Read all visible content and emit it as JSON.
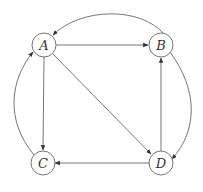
{
  "diagram": {
    "type": "directed-graph",
    "nodes": [
      {
        "id": "A",
        "label": "A"
      },
      {
        "id": "B",
        "label": "B"
      },
      {
        "id": "C",
        "label": "C"
      },
      {
        "id": "D",
        "label": "D"
      }
    ],
    "edges": [
      {
        "from": "A",
        "to": "B",
        "style": "straight"
      },
      {
        "from": "A",
        "to": "C",
        "style": "straight"
      },
      {
        "from": "A",
        "to": "D",
        "style": "straight"
      },
      {
        "from": "D",
        "to": "B",
        "style": "straight"
      },
      {
        "from": "D",
        "to": "C",
        "style": "straight"
      },
      {
        "from": "B",
        "to": "A",
        "style": "curved"
      },
      {
        "from": "B",
        "to": "D",
        "style": "curved"
      },
      {
        "from": "C",
        "to": "A",
        "style": "curved"
      }
    ],
    "colors": {
      "stroke": "#555555",
      "background": "#ffffff"
    }
  }
}
